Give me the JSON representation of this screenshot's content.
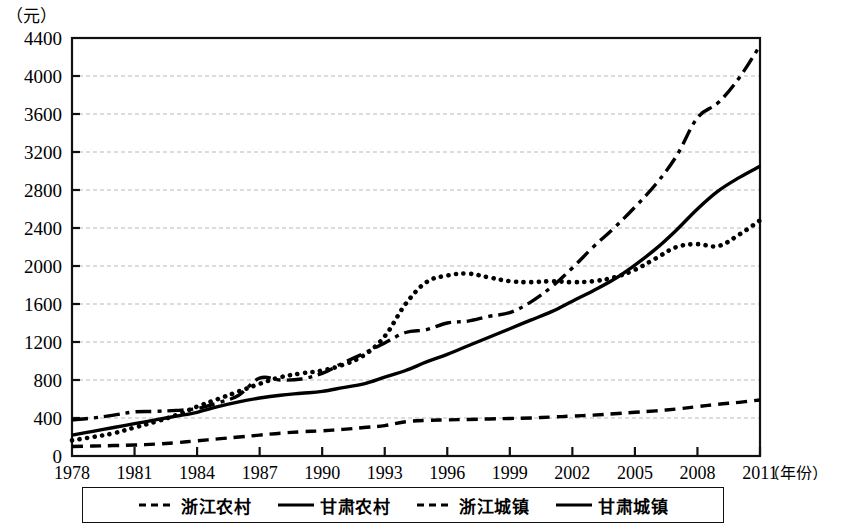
{
  "axes": {
    "unit_label": "（元）",
    "x_title": "（年份）",
    "y_ticks": [
      "0",
      "400",
      "800",
      "1200",
      "1600",
      "2000",
      "2400",
      "2800",
      "3200",
      "3600",
      "4000",
      "4400"
    ],
    "x_ticks": [
      "1978",
      "1981",
      "1984",
      "1987",
      "1990",
      "1993",
      "1996",
      "1999",
      "2002",
      "2005",
      "2008",
      "2011"
    ]
  },
  "legend": {
    "items": [
      {
        "label": "浙江农村",
        "style": "dashed"
      },
      {
        "label": "甘肃农村",
        "style": "solid"
      },
      {
        "label": "浙江城镇",
        "style": "dashed"
      },
      {
        "label": "甘肃城镇",
        "style": "solid"
      }
    ]
  },
  "chart_data": {
    "type": "line",
    "title": "",
    "xlabel": "（年份）",
    "ylabel": "（元）",
    "xlim": [
      1978,
      2011
    ],
    "ylim": [
      0,
      4400
    ],
    "grid": true,
    "legend_position": "bottom",
    "x": [
      1978,
      1979,
      1980,
      1981,
      1982,
      1983,
      1984,
      1985,
      1986,
      1987,
      1988,
      1989,
      1990,
      1991,
      1992,
      1993,
      1994,
      1995,
      1996,
      1997,
      1998,
      1999,
      2000,
      2001,
      2002,
      2003,
      2004,
      2005,
      2006,
      2007,
      2008,
      2009,
      2010,
      2011
    ],
    "series": [
      {
        "name": "浙江城镇",
        "style": "dashdot",
        "values": [
          380,
          400,
          430,
          465,
          470,
          480,
          500,
          560,
          640,
          820,
          800,
          810,
          870,
          980,
          1080,
          1190,
          1300,
          1330,
          1400,
          1420,
          1470,
          1510,
          1620,
          1780,
          1980,
          2200,
          2400,
          2620,
          2860,
          3160,
          3560,
          3720,
          3980,
          4320
        ]
      },
      {
        "name": "浙江农村",
        "style": "dotted",
        "values": [
          165,
          200,
          240,
          300,
          360,
          430,
          520,
          600,
          680,
          760,
          830,
          870,
          900,
          960,
          1060,
          1260,
          1600,
          1830,
          1900,
          1920,
          1880,
          1840,
          1830,
          1840,
          1830,
          1840,
          1880,
          1960,
          2080,
          2200,
          2230,
          2210,
          2330,
          2480
        ]
      },
      {
        "name": "甘肃城镇",
        "style": "solid",
        "values": [
          220,
          260,
          300,
          340,
          380,
          420,
          460,
          520,
          570,
          610,
          640,
          660,
          680,
          720,
          760,
          830,
          900,
          990,
          1070,
          1160,
          1250,
          1340,
          1430,
          1520,
          1630,
          1740,
          1860,
          2010,
          2180,
          2380,
          2600,
          2790,
          2930,
          3050
        ]
      },
      {
        "name": "甘肃农村",
        "style": "dashed",
        "values": [
          100,
          105,
          110,
          115,
          125,
          140,
          160,
          180,
          200,
          220,
          240,
          255,
          265,
          280,
          300,
          320,
          360,
          375,
          380,
          385,
          390,
          395,
          400,
          410,
          420,
          430,
          445,
          460,
          475,
          495,
          520,
          545,
          565,
          590
        ]
      }
    ]
  }
}
